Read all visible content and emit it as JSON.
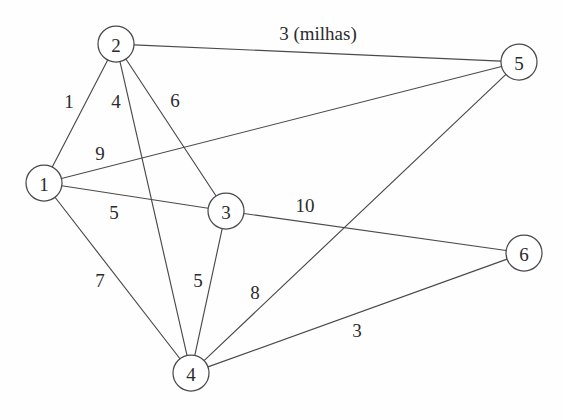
{
  "diagram": {
    "background_color": "#fefefe",
    "stroke_color": "#4a4a4a",
    "text_color": "#2b2b2b",
    "node_radius": 18,
    "width": 563,
    "height": 420
  },
  "nodes": [
    {
      "id": "1",
      "label": "1",
      "x": 44,
      "y": 183
    },
    {
      "id": "2",
      "label": "2",
      "x": 116,
      "y": 44
    },
    {
      "id": "3",
      "label": "3",
      "x": 226,
      "y": 211
    },
    {
      "id": "4",
      "label": "4",
      "x": 191,
      "y": 373
    },
    {
      "id": "5",
      "label": "5",
      "x": 519,
      "y": 62
    },
    {
      "id": "6",
      "label": "6",
      "x": 524,
      "y": 253
    }
  ],
  "edges": [
    {
      "from": "1",
      "to": "2",
      "weight": "1",
      "label_x": 69,
      "label_y": 101
    },
    {
      "from": "2",
      "to": "4",
      "weight": "4",
      "label_x": 116,
      "label_y": 101
    },
    {
      "from": "2",
      "to": "3",
      "weight": "6",
      "label_x": 175,
      "label_y": 100
    },
    {
      "from": "2",
      "to": "5",
      "weight": "3 (milhas)",
      "label_x": 318,
      "label_y": 33
    },
    {
      "from": "1",
      "to": "5",
      "weight": "9",
      "label_x": 100,
      "label_y": 153
    },
    {
      "from": "1",
      "to": "3",
      "weight": "5",
      "label_x": 114,
      "label_y": 212
    },
    {
      "from": "1",
      "to": "4",
      "weight": "7",
      "label_x": 100,
      "label_y": 280
    },
    {
      "from": "3",
      "to": "4",
      "weight": "5",
      "label_x": 198,
      "label_y": 280
    },
    {
      "from": "3",
      "to": "6",
      "weight": "10",
      "label_x": 305,
      "label_y": 205
    },
    {
      "from": "4",
      "to": "5",
      "weight": "8",
      "label_x": 255,
      "label_y": 292
    },
    {
      "from": "4",
      "to": "6",
      "weight": "3",
      "label_x": 357,
      "label_y": 330
    }
  ]
}
